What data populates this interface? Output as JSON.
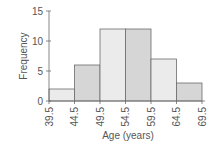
{
  "chart_data": {
    "type": "bar",
    "title": "",
    "xlabel": "Age (years)",
    "ylabel": "Frequency",
    "categories": [
      "39.5–44.5",
      "44.5–49.5",
      "49.5–54.5",
      "54.5–59.5",
      "59.5–64.5",
      "64.5–69.5"
    ],
    "bin_edges": [
      39.5,
      44.5,
      49.5,
      54.5,
      59.5,
      64.5,
      69.5
    ],
    "values": [
      2,
      6,
      12,
      12,
      7,
      3
    ],
    "y_ticks": [
      0,
      5,
      10,
      15
    ],
    "ylim": [
      0,
      15
    ],
    "grid": false,
    "legend": null,
    "histogram": true,
    "bar_colors": [
      "#ebebeb",
      "#d6d6d6",
      "#ebebeb",
      "#d6d6d6",
      "#ebebeb",
      "#d6d6d6"
    ]
  },
  "labels": {
    "xlabel": "Age (years)",
    "ylabel": "Frequency"
  }
}
